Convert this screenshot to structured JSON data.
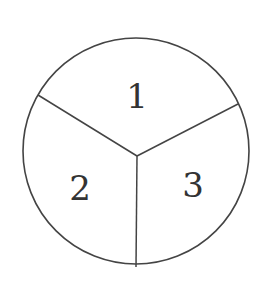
{
  "diagram": {
    "type": "spinner-circle",
    "sections": [
      {
        "label": "1",
        "position": "top"
      },
      {
        "label": "2",
        "position": "bottom-left"
      },
      {
        "label": "3",
        "position": "bottom-right"
      }
    ],
    "stroke_color": "#444444",
    "background": "#ffffff"
  }
}
